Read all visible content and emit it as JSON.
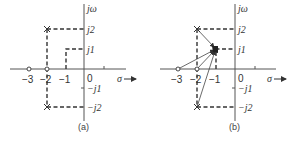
{
  "panels": [
    {
      "id": "a",
      "caption": "(a)",
      "axis_labels": {
        "imag": "jω",
        "real": "σ"
      },
      "real_ticks": [
        "−3",
        "−2",
        "−1",
        "0"
      ],
      "imag_ticks": [
        "j2",
        "j1",
        "−j1",
        "−j2"
      ],
      "poles": [
        {
          "re": -2,
          "im": 2
        },
        {
          "re": -2,
          "im": -2
        }
      ],
      "zeros": [
        {
          "re": -3,
          "im": 0
        },
        {
          "re": -2,
          "im": 0
        }
      ],
      "test_point": {
        "re": -1,
        "im": 1
      }
    },
    {
      "id": "b",
      "caption": "(b)",
      "axis_labels": {
        "imag": "jω",
        "real": "σ"
      },
      "real_ticks": [
        "−3",
        "−2",
        "−1",
        "0"
      ],
      "imag_ticks": [
        "j2",
        "j1",
        "−j1",
        "−j2"
      ],
      "poles": [
        {
          "re": -2,
          "im": 2
        },
        {
          "re": -2,
          "im": -2
        }
      ],
      "zeros": [
        {
          "re": -3,
          "im": 0
        },
        {
          "re": -2,
          "im": 0
        }
      ],
      "test_point": {
        "re": -1,
        "im": 1
      },
      "vectors_to_test_point": true
    }
  ]
}
